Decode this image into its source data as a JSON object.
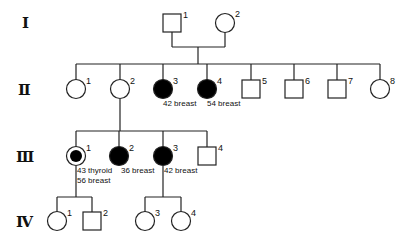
{
  "generations": [
    {
      "label": "I"
    },
    {
      "label": "Ⅱ"
    },
    {
      "label": "Ⅲ"
    },
    {
      "label": "Ⅳ"
    }
  ],
  "individuals": {
    "I": [
      {
        "id": "1",
        "sex": "male",
        "affected": false
      },
      {
        "id": "2",
        "sex": "female",
        "affected": false
      }
    ],
    "II": [
      {
        "id": "1",
        "sex": "female",
        "affected": false
      },
      {
        "id": "2",
        "sex": "female",
        "affected": false
      },
      {
        "id": "3",
        "sex": "female",
        "affected": true,
        "note": "42 breast"
      },
      {
        "id": "4",
        "sex": "female",
        "affected": true,
        "note": "54 breast"
      },
      {
        "id": "5",
        "sex": "male",
        "affected": false
      },
      {
        "id": "6",
        "sex": "male",
        "affected": false
      },
      {
        "id": "7",
        "sex": "male",
        "affected": false
      },
      {
        "id": "8",
        "sex": "female",
        "affected": false
      }
    ],
    "III": [
      {
        "id": "1",
        "sex": "female",
        "affected": true,
        "proband": true,
        "note1": "43 thyroid",
        "note2": "56 breast"
      },
      {
        "id": "2",
        "sex": "female",
        "affected": true,
        "note": "36 breast"
      },
      {
        "id": "3",
        "sex": "female",
        "affected": true,
        "note": "42 breast"
      },
      {
        "id": "4",
        "sex": "male",
        "affected": false
      }
    ],
    "IV": [
      {
        "id": "1",
        "sex": "female",
        "affected": false
      },
      {
        "id": "2",
        "sex": "male",
        "affected": false
      },
      {
        "id": "3",
        "sex": "female",
        "affected": false
      },
      {
        "id": "4",
        "sex": "female",
        "affected": false
      }
    ]
  }
}
